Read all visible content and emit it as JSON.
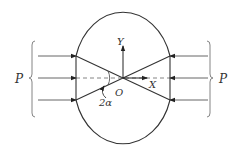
{
  "diagram": {
    "labels": {
      "load_left": "P",
      "load_right": "P",
      "axis_y": "Y",
      "axis_x": "X",
      "origin": "O",
      "angle": "2α"
    },
    "colors": {
      "stroke": "#333333",
      "load_line": "#555555",
      "brace": "#777777"
    }
  }
}
